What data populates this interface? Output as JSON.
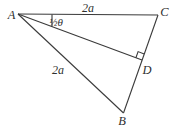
{
  "figure": {
    "background": "#ffffff",
    "line_color": "#3a3a3a",
    "points": {
      "A": [
        18,
        14
      ],
      "C": [
        158,
        15
      ],
      "D": [
        142,
        60
      ],
      "B": [
        123.5,
        113
      ]
    },
    "edges": [
      {
        "from": "A",
        "to": "C",
        "name": "edge-AC"
      },
      {
        "from": "A",
        "to": "D",
        "name": "edge-AD"
      },
      {
        "from": "A",
        "to": "B",
        "name": "edge-AB"
      },
      {
        "from": "C",
        "to": "B",
        "name": "edge-CB"
      }
    ],
    "vertex_labels": [
      {
        "text": "A",
        "x": 11.5,
        "y": 18.5
      },
      {
        "text": "C",
        "x": 164.5,
        "y": 15.5
      },
      {
        "text": "D",
        "x": 147,
        "y": 73.5
      },
      {
        "text": "B",
        "x": 122,
        "y": 124.5
      }
    ],
    "side_labels": [
      {
        "text": "2a",
        "x": 88,
        "y": 12,
        "side": "AC"
      },
      {
        "text": "2a",
        "x": 58,
        "y": 74,
        "side": "AB"
      }
    ],
    "angle_label": {
      "text": "½θ",
      "x": 56,
      "y": 25.5
    },
    "angle_tick": {
      "x1": 52,
      "y1": 14.4,
      "x2": 52,
      "y2": 26.4
    },
    "right_angle_marker": {
      "vertex": "D",
      "toward": [
        "A",
        "C"
      ],
      "size": 6.5
    }
  }
}
